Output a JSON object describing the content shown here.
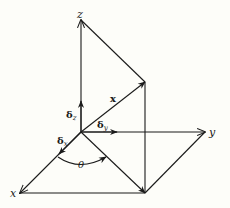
{
  "diagram": {
    "type": "3d-coordinate-vector-diagram",
    "axes": {
      "z_label": "z",
      "y_label": "y",
      "x_label": "x"
    },
    "vector": {
      "label": "x",
      "style": "bold"
    },
    "unit_vectors": [
      {
        "symbol": "δ",
        "subscript": "z"
      },
      {
        "symbol": "δ",
        "subscript": "y"
      },
      {
        "symbol": "δ",
        "subscript": "x"
      }
    ],
    "angle": {
      "label": "θ"
    },
    "colors": {
      "ink": "#1a1a1a",
      "background": "#fdfdf9"
    }
  }
}
